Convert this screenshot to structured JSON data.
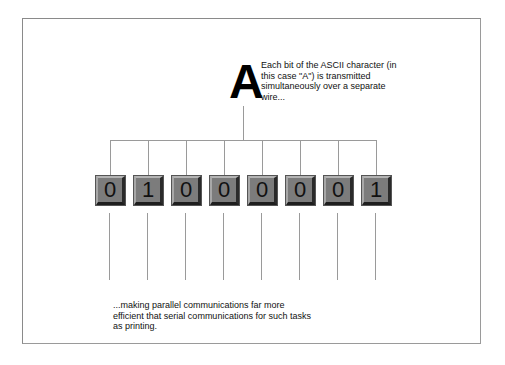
{
  "diagram": {
    "character": "A",
    "top_caption": "Each bit of the ASCII character (in this case \"A\") is transmitted simultaneously over a separate wire...",
    "bottom_caption": "...making parallel communications far more efficient that serial communications for such tasks as printing.",
    "bits": [
      "0",
      "1",
      "0",
      "0",
      "0",
      "0",
      "0",
      "1"
    ],
    "colors": {
      "bit_fill": "#7c7c7c",
      "wire": "#9a9a9a",
      "frame": "#8a8a8a"
    }
  }
}
